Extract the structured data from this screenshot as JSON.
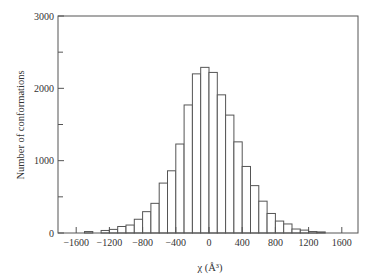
{
  "chart_data": {
    "type": "bar",
    "title": "",
    "xlabel": "χ (Å³)",
    "ylabel": "Number of conformations",
    "xlim": [
      -1800,
      1800
    ],
    "ylim": [
      0,
      3000
    ],
    "bin_width": 100,
    "x_ticks": [
      -1600,
      -1200,
      -800,
      -400,
      0,
      400,
      800,
      1200,
      1600
    ],
    "y_ticks": [
      0,
      1000,
      2000,
      3000
    ],
    "y_minor_ticks": [
      500,
      1500,
      2500
    ],
    "grid": false,
    "legend": null,
    "bins": [
      {
        "x0": -1500,
        "x1": -1400,
        "count": 20
      },
      {
        "x0": -1400,
        "x1": -1300,
        "count": 0
      },
      {
        "x0": -1300,
        "x1": -1200,
        "count": 35
      },
      {
        "x0": -1200,
        "x1": -1100,
        "count": 50
      },
      {
        "x0": -1100,
        "x1": -1000,
        "count": 90
      },
      {
        "x0": -1000,
        "x1": -900,
        "count": 110
      },
      {
        "x0": -900,
        "x1": -800,
        "count": 190
      },
      {
        "x0": -800,
        "x1": -700,
        "count": 295
      },
      {
        "x0": -700,
        "x1": -600,
        "count": 410
      },
      {
        "x0": -600,
        "x1": -500,
        "count": 690
      },
      {
        "x0": -500,
        "x1": -400,
        "count": 860
      },
      {
        "x0": -400,
        "x1": -300,
        "count": 1230
      },
      {
        "x0": -300,
        "x1": -200,
        "count": 1770
      },
      {
        "x0": -200,
        "x1": -100,
        "count": 2200
      },
      {
        "x0": -100,
        "x1": 0,
        "count": 2290
      },
      {
        "x0": 0,
        "x1": 100,
        "count": 2220
      },
      {
        "x0": 100,
        "x1": 200,
        "count": 1910
      },
      {
        "x0": 200,
        "x1": 300,
        "count": 1630
      },
      {
        "x0": 300,
        "x1": 400,
        "count": 1260
      },
      {
        "x0": 400,
        "x1": 500,
        "count": 920
      },
      {
        "x0": 500,
        "x1": 600,
        "count": 655
      },
      {
        "x0": 600,
        "x1": 700,
        "count": 440
      },
      {
        "x0": 700,
        "x1": 800,
        "count": 270
      },
      {
        "x0": 800,
        "x1": 900,
        "count": 165
      },
      {
        "x0": 900,
        "x1": 1000,
        "count": 125
      },
      {
        "x0": 1000,
        "x1": 1100,
        "count": 55
      },
      {
        "x0": 1100,
        "x1": 1200,
        "count": 40
      },
      {
        "x0": 1200,
        "x1": 1300,
        "count": 20
      },
      {
        "x0": 1300,
        "x1": 1400,
        "count": 15
      }
    ]
  },
  "colors": {
    "bar_fill": "#ffffff",
    "bar_stroke": "#555555",
    "axis": "#555555",
    "text": "#333333"
  }
}
